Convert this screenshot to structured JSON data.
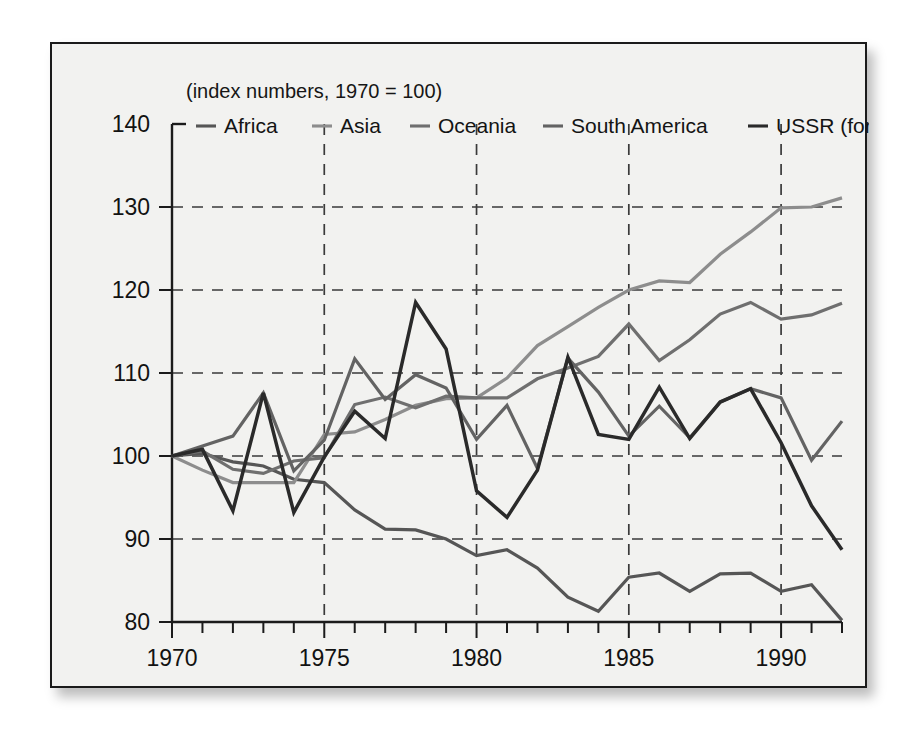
{
  "figure": {
    "subtitle": "(index numbers, 1970 = 100)",
    "background_color": "#f2f2f0",
    "border_color": "#1b1b1b"
  },
  "chart_data": {
    "type": "line",
    "title": "",
    "subtitle": "(index numbers, 1970 = 100)",
    "xlabel": "",
    "ylabel": "",
    "xlim": [
      1970,
      1992
    ],
    "ylim": [
      80,
      140
    ],
    "yticks": [
      80,
      90,
      100,
      110,
      120,
      130,
      140
    ],
    "ytick_labels": [
      "80",
      "90",
      "100",
      "110",
      "120",
      "130",
      "140"
    ],
    "xticks": [
      1970,
      1975,
      1980,
      1985,
      1990
    ],
    "xtick_labels": [
      "1970",
      "1975",
      "1980",
      "1985",
      "1990"
    ],
    "x_minor_tick_interval": 1,
    "grid": true,
    "grid_style": "dashed",
    "grid_axis": "both",
    "legend_position": "top-inside",
    "x": [
      1970,
      1971,
      1972,
      1973,
      1974,
      1975,
      1976,
      1977,
      1978,
      1979,
      1980,
      1981,
      1982,
      1983,
      1984,
      1985,
      1986,
      1987,
      1988,
      1989,
      1990,
      1991,
      1992
    ],
    "series": [
      {
        "name": "Africa",
        "color": "#565656",
        "values": [
          100.0,
          100.3,
          99.3,
          98.8,
          97.2,
          96.8,
          93.5,
          91.2,
          91.1,
          90.0,
          88.0,
          88.7,
          86.5,
          83.0,
          81.3,
          85.4,
          85.9,
          83.7,
          85.8,
          85.9,
          83.7,
          84.5,
          80.2
        ]
      },
      {
        "name": "Asia",
        "color": "#8d8d8d",
        "values": [
          100.0,
          98.3,
          96.8,
          96.8,
          96.8,
          102.6,
          102.9,
          104.4,
          106.1,
          106.9,
          107.0,
          109.4,
          113.3,
          115.6,
          117.9,
          120.0,
          121.1,
          120.9,
          124.3,
          127.0,
          129.9,
          130.0,
          131.1
        ]
      },
      {
        "name": "Oceania",
        "color": "#6f6f6f",
        "values": [
          100.0,
          100.6,
          98.4,
          97.9,
          99.4,
          99.8,
          106.2,
          107.1,
          105.8,
          107.2,
          107.0,
          107.0,
          109.3,
          110.6,
          112.0,
          115.9,
          111.5,
          114.0,
          117.1,
          118.5,
          116.5,
          117.0,
          118.4
        ]
      },
      {
        "name": "South America",
        "color": "#636363",
        "values": [
          100.0,
          101.2,
          102.4,
          107.6,
          98.2,
          101.9,
          111.7,
          106.8,
          109.8,
          108.2,
          102.0,
          106.1,
          98.5,
          111.8,
          107.7,
          102.4,
          106.0,
          102.2,
          106.5,
          108.1,
          107.0,
          99.5,
          104.2
        ]
      },
      {
        "name": "USSR (former)",
        "color": "#2a2a2a",
        "values": [
          100.0,
          100.8,
          93.4,
          107.6,
          93.2,
          99.9,
          105.4,
          102.1,
          118.5,
          112.9,
          95.8,
          92.6,
          98.3,
          111.9,
          102.6,
          102.0,
          108.3,
          102.1,
          106.5,
          108.1,
          101.6,
          94.0,
          88.7
        ]
      }
    ]
  },
  "legend": [
    {
      "label": "Africa",
      "color": "#565656"
    },
    {
      "label": "Asia",
      "color": "#8d8d8d"
    },
    {
      "label": "Oceania",
      "color": "#6f6f6f"
    },
    {
      "label": "South America",
      "color": "#636363"
    },
    {
      "label": "USSR (former)",
      "color": "#2a2a2a"
    }
  ]
}
